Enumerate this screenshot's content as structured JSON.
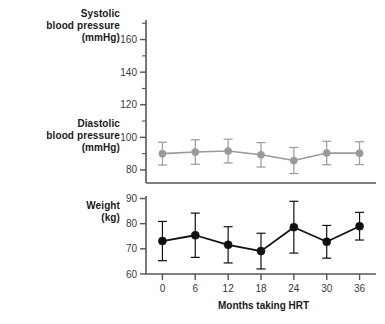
{
  "figure": {
    "background": "#ffffff",
    "panels": [
      {
        "id": "blood-pressure",
        "label_lines": [
          "Systolic",
          "blood pressure",
          "(mmHg)"
        ],
        "label_secondary_lines": [
          "Diastolic",
          "blood pressure",
          "(mmHg)"
        ]
      },
      {
        "id": "weight",
        "label_lines": [
          "Weight",
          "(kg)"
        ]
      }
    ],
    "xlabel": "Months taking HRT"
  },
  "labels": {
    "systolic_line1": "Systolic",
    "systolic_line2": "blood pressure",
    "systolic_line3": "(mmHg)",
    "diastolic_line1": "Diastolic",
    "diastolic_line2": "blood pressure",
    "diastolic_line3": "(mmHg)",
    "weight_line1": "Weight",
    "weight_line2": "(kg)",
    "xaxis": "Months taking HRT"
  },
  "chart_data": [
    {
      "type": "line",
      "id": "blood-pressure-panel",
      "title": "",
      "xlabel": "",
      "ylabel": "blood pressure (mmHg)",
      "x": [
        0,
        6,
        12,
        18,
        24,
        30,
        36
      ],
      "xticklabels": [
        "0",
        "6",
        "12",
        "18",
        "24",
        "30",
        "36"
      ],
      "xlim": [
        -3,
        39
      ],
      "ylim": [
        72,
        172
      ],
      "yticks": [
        80,
        100,
        120,
        140,
        160
      ],
      "yticklabels": [
        "80",
        "100",
        "120",
        "140",
        "160"
      ],
      "yminorticks": [
        90,
        110,
        130,
        150,
        170
      ],
      "grid": false,
      "legend": "none",
      "series": [
        {
          "name": "Diastolic blood pressure",
          "color": "#9a9a9a",
          "marker": "circle-filled",
          "values": [
            90.0,
            91.0,
            91.6,
            89.3,
            85.8,
            90.4,
            90.3
          ],
          "errors": [
            7.0,
            7.5,
            7.3,
            7.5,
            8.0,
            7.2,
            7.0
          ]
        }
      ]
    },
    {
      "type": "line",
      "id": "weight-panel",
      "title": "",
      "xlabel": "Months taking HRT",
      "ylabel": "Weight (kg)",
      "x": [
        0,
        6,
        12,
        18,
        24,
        30,
        36
      ],
      "xticklabels": [
        "0",
        "6",
        "12",
        "18",
        "24",
        "30",
        "36"
      ],
      "xlim": [
        -3,
        39
      ],
      "ylim": [
        60,
        91
      ],
      "yticks": [
        60,
        70,
        80,
        90
      ],
      "yticklabels": [
        "60",
        "70",
        "80",
        "90"
      ],
      "grid": false,
      "legend": "none",
      "series": [
        {
          "name": "Weight",
          "color": "#111111",
          "marker": "circle-filled",
          "values": [
            73.1,
            75.4,
            71.6,
            69.1,
            78.6,
            72.8,
            79.0
          ],
          "errors": [
            7.8,
            8.8,
            7.2,
            7.1,
            10.3,
            6.5,
            5.5
          ]
        }
      ]
    }
  ]
}
